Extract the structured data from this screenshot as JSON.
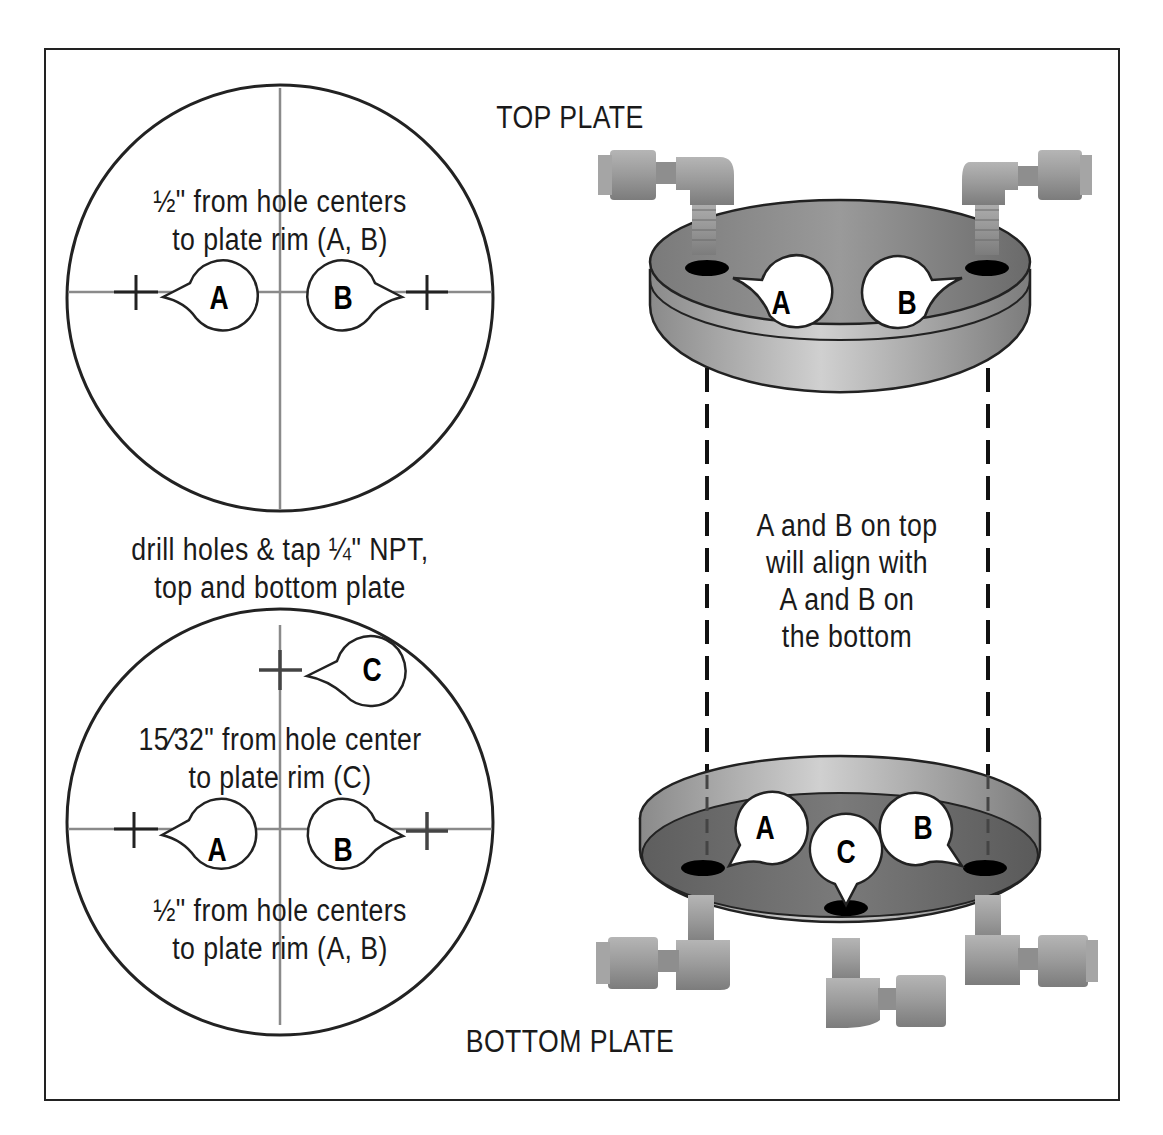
{
  "labels": {
    "top_plate": "TOP PLATE",
    "bottom_plate": "BOTTOM PLATE"
  },
  "top_circle": {
    "note_line1": "½\" from hole centers",
    "note_line2": "to plate rim (A, B)",
    "markers": [
      "A",
      "B"
    ]
  },
  "drill_note": {
    "line1": "drill holes & tap ¼\" NPT,",
    "line2": "top and bottom plate"
  },
  "bottom_circle": {
    "note_c_line1": "15⁄32\" from hole center",
    "note_c_line2": "to plate rim (C)",
    "note_ab_line1": "½\" from hole centers",
    "note_ab_line2": "to plate rim (A, B)",
    "markers": [
      "A",
      "B",
      "C"
    ]
  },
  "alignment_note": {
    "line1": "A and B on top",
    "line2": "will align with",
    "line3": "A and B on",
    "line4": "the bottom"
  },
  "top_plate_markers": [
    "A",
    "B"
  ],
  "bottom_plate_markers": [
    "A",
    "C",
    "B"
  ],
  "colors": {
    "frame": "#222222",
    "plate_dark": "#6e6e6e",
    "plate_light": "#c8c8c8",
    "fitting": "#9a9a9a",
    "crosshair": "#8a8a8a",
    "text": "#1a1a1a"
  }
}
